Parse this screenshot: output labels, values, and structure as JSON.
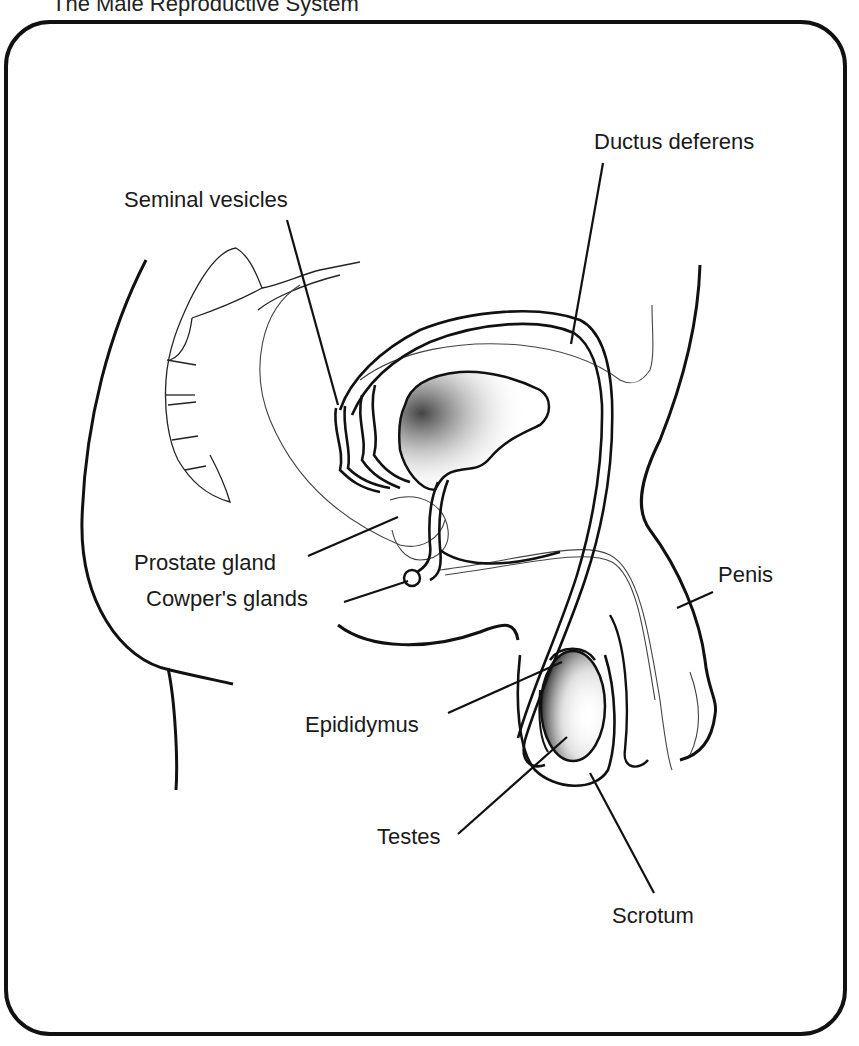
{
  "title": "The Male Reproductive System",
  "colors": {
    "ink": "#111111",
    "background": "#ffffff",
    "stipple": "#333333"
  },
  "labels": {
    "seminal_vesicles": "Seminal vesicles",
    "ductus_deferens": "Ductus deferens",
    "prostate_gland": "Prostate gland",
    "cowpers_glands": "Cowper's glands",
    "penis": "Penis",
    "epididymus": "Epididymus",
    "testes": "Testes",
    "scrotum": "Scrotum"
  }
}
